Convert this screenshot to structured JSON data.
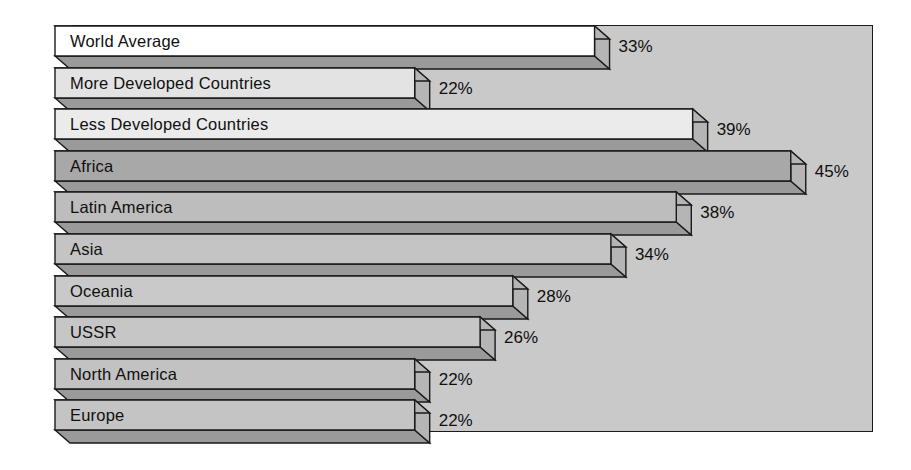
{
  "chart_data": {
    "type": "bar",
    "orientation": "horizontal",
    "title": "",
    "subtitle": "",
    "xlabel": "",
    "ylabel": "",
    "xlim": [
      0,
      50
    ],
    "grid": false,
    "legend": null,
    "value_suffix": "%",
    "categories": [
      "World Average",
      "More Developed Countries",
      "Less Developed Countries",
      "Africa",
      "Latin America",
      "Asia",
      "Oceania",
      "USSR",
      "North America",
      "Europe"
    ],
    "values": [
      33,
      22,
      39,
      45,
      38,
      34,
      28,
      26,
      22,
      22
    ],
    "value_labels": [
      "33%",
      "22%",
      "39%",
      "45%",
      "38%",
      "34%",
      "28%",
      "26%",
      "22%",
      "22%"
    ],
    "bars": [
      {
        "label": "World Average",
        "value": 33,
        "value_label": "33%",
        "face_color": "#ffffff"
      },
      {
        "label": "More Developed Countries",
        "value": 22,
        "value_label": "22%",
        "face_color": "#e3e3e3"
      },
      {
        "label": "Less Developed Countries",
        "value": 39,
        "value_label": "39%",
        "face_color": "#ebebeb"
      },
      {
        "label": "Africa",
        "value": 45,
        "value_label": "45%",
        "face_color": "#a8a8a8"
      },
      {
        "label": "Latin America",
        "value": 38,
        "value_label": "38%",
        "face_color": "#bdbdbd"
      },
      {
        "label": "Asia",
        "value": 34,
        "value_label": "34%",
        "face_color": "#c4c4c4"
      },
      {
        "label": "Oceania",
        "value": 28,
        "value_label": "28%",
        "face_color": "#c9c9c9"
      },
      {
        "label": "USSR",
        "value": 26,
        "value_label": "26%",
        "face_color": "#c6c6c6"
      },
      {
        "label": "North America",
        "value": 22,
        "value_label": "22%",
        "face_color": "#c2c2c2"
      },
      {
        "label": "Europe",
        "value": 22,
        "value_label": "22%",
        "face_color": "#c4c4c4"
      }
    ],
    "colors": {
      "plot_background": "#c9c9c9",
      "page_background": "#ffffff",
      "outline": "#1a1a1a",
      "text": "#101010",
      "bar_top_face": "#b5b5b5",
      "bar_shadow_face": "#9a9a9a"
    }
  }
}
